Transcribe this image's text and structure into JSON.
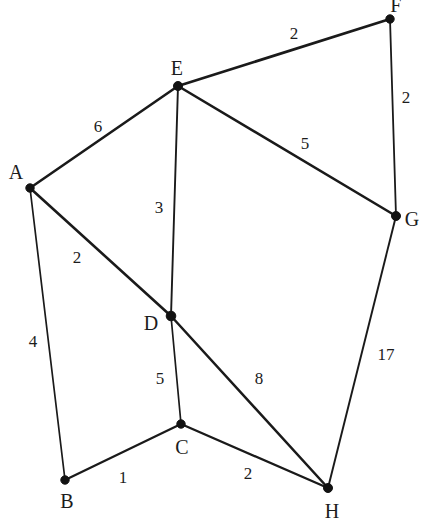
{
  "diagram": {
    "kind": "weighted-undirected-graph",
    "canvas": {
      "width": 423,
      "height": 532
    },
    "style": {
      "background_color": "#ffffff",
      "edge_color": "#1a1a1a",
      "node_color": "#121212",
      "label_color": "#1c1c1c"
    }
  },
  "nodes": [
    {
      "id": "A",
      "label": "A",
      "x": 30,
      "y": 188,
      "radius": 4.2,
      "label_x": 16,
      "label_y": 172
    },
    {
      "id": "B",
      "label": "B",
      "x": 65,
      "y": 480,
      "radius": 4.2,
      "label_x": 67,
      "label_y": 501
    },
    {
      "id": "C",
      "label": "C",
      "x": 181,
      "y": 424,
      "radius": 4.2,
      "label_x": 182,
      "label_y": 447
    },
    {
      "id": "D",
      "label": "D",
      "x": 171,
      "y": 316,
      "radius": 4.8,
      "label_x": 151,
      "label_y": 323
    },
    {
      "id": "E",
      "label": "E",
      "x": 178,
      "y": 86,
      "radius": 4.5,
      "label_x": 177,
      "label_y": 68
    },
    {
      "id": "F",
      "label": "F",
      "x": 390,
      "y": 19,
      "radius": 4.2,
      "label_x": 396,
      "label_y": 5
    },
    {
      "id": "G",
      "label": "G",
      "x": 396,
      "y": 216,
      "radius": 4.5,
      "label_x": 412,
      "label_y": 219
    },
    {
      "id": "H",
      "label": "H",
      "x": 328,
      "y": 488,
      "radius": 4.5,
      "label_x": 332,
      "label_y": 511
    }
  ],
  "edges": [
    {
      "id": "A-E",
      "source": "A",
      "target": "E",
      "weight": "6",
      "width": 2.6,
      "label_x": 98,
      "label_y": 126
    },
    {
      "id": "A-D",
      "source": "A",
      "target": "D",
      "weight": "2",
      "width": 2.6,
      "label_x": 77,
      "label_y": 257
    },
    {
      "id": "A-B",
      "source": "A",
      "target": "B",
      "weight": "4",
      "width": 1.7,
      "label_x": 33,
      "label_y": 341
    },
    {
      "id": "E-F",
      "source": "E",
      "target": "F",
      "weight": "2",
      "width": 2.7,
      "label_x": 294,
      "label_y": 33
    },
    {
      "id": "E-G",
      "source": "E",
      "target": "G",
      "weight": "5",
      "width": 2.6,
      "label_x": 305,
      "label_y": 143
    },
    {
      "id": "E-D",
      "source": "E",
      "target": "D",
      "weight": "3",
      "width": 1.9,
      "label_x": 159,
      "label_y": 207
    },
    {
      "id": "F-G",
      "source": "F",
      "target": "G",
      "weight": "2",
      "width": 1.8,
      "label_x": 406,
      "label_y": 97
    },
    {
      "id": "G-H",
      "source": "G",
      "target": "H",
      "weight": "17",
      "width": 1.9,
      "label_x": 386,
      "label_y": 354
    },
    {
      "id": "D-C",
      "source": "D",
      "target": "C",
      "weight": "5",
      "width": 1.7,
      "label_x": 160,
      "label_y": 378
    },
    {
      "id": "D-H",
      "source": "D",
      "target": "H",
      "weight": "8",
      "width": 2.5,
      "label_x": 259,
      "label_y": 378
    },
    {
      "id": "B-C",
      "source": "B",
      "target": "C",
      "weight": "1",
      "width": 2.3,
      "label_x": 123,
      "label_y": 477
    },
    {
      "id": "C-H",
      "source": "C",
      "target": "H",
      "weight": "2",
      "width": 2.3,
      "label_x": 248,
      "label_y": 473
    }
  ]
}
